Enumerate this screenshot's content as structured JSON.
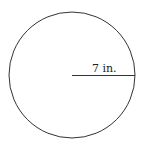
{
  "diagram": {
    "shape": "circle",
    "radius_label": "7 in.",
    "stroke_color": "#333333",
    "background_color": "#ffffff"
  }
}
